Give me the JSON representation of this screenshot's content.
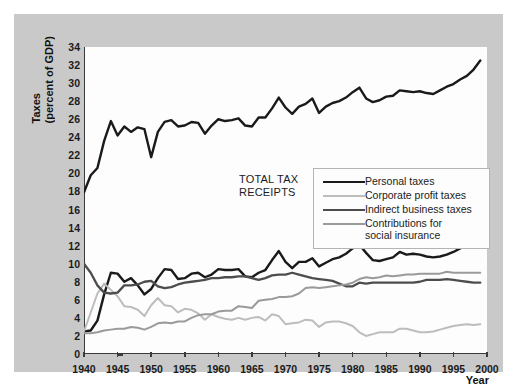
{
  "figure": {
    "annotation": "TOTAL TAX\nRECEIPTS",
    "annotation_line1": "TOTAL TAX",
    "annotation_line2": "RECEIPTS",
    "ytitle_line1": "Taxes",
    "ytitle_line2": "(percent of GDP)",
    "xtitle": "Year",
    "panel_color": "#c9c9c9",
    "plot_bg": "#fdfdfd",
    "axis_color": "#3a3a3a"
  },
  "legend": {
    "position": "inside-upper-center",
    "entries": [
      {
        "label": "Personal taxes",
        "color": "#1a1a1a",
        "width": 2.6
      },
      {
        "label": "Corporate profit taxes",
        "color": "#bdbdbd",
        "width": 2.0
      },
      {
        "label": "Indirect business taxes",
        "color": "#4d4d4d",
        "width": 2.4
      },
      {
        "label": "Contributions for",
        "label2": "social insurance",
        "color": "#9a9a9a",
        "width": 2.0
      }
    ]
  },
  "chart_data": {
    "type": "line",
    "title": "",
    "subtitle": "",
    "xlabel": "Year",
    "ylabel": "Taxes (percent of GDP)",
    "xlim": [
      1940,
      2000
    ],
    "ylim": [
      0,
      34
    ],
    "xticks": [
      1940,
      1945,
      1950,
      1955,
      1960,
      1965,
      1970,
      1975,
      1980,
      1985,
      1990,
      1995,
      2000
    ],
    "yticks": [
      0,
      2,
      4,
      6,
      8,
      10,
      12,
      14,
      16,
      18,
      20,
      22,
      24,
      26,
      28,
      30,
      32,
      34
    ],
    "grid": false,
    "legend_position": "inside-upper-center",
    "annotations": [
      {
        "text": "TOTAL TAX RECEIPTS",
        "x": 1953,
        "y": 23.0
      }
    ],
    "x": [
      1940,
      1941,
      1942,
      1943,
      1944,
      1945,
      1946,
      1947,
      1948,
      1949,
      1950,
      1951,
      1952,
      1953,
      1954,
      1955,
      1956,
      1957,
      1958,
      1959,
      1960,
      1961,
      1962,
      1963,
      1964,
      1965,
      1966,
      1967,
      1968,
      1969,
      1970,
      1971,
      1972,
      1973,
      1974,
      1975,
      1976,
      1977,
      1978,
      1979,
      1980,
      1981,
      1982,
      1983,
      1984,
      1985,
      1986,
      1987,
      1988,
      1989,
      1990,
      1991,
      1992,
      1993,
      1994,
      1995,
      1996,
      1997,
      1998,
      1999
    ],
    "series": [
      {
        "name": "Total tax receipts",
        "color": "#1a1a1a",
        "width": 2.4,
        "labeled_on_chart": true,
        "values": [
          17.9,
          19.8,
          20.6,
          23.6,
          25.8,
          24.2,
          25.2,
          24.6,
          25.1,
          24.9,
          21.8,
          24.6,
          25.7,
          25.9,
          25.2,
          25.3,
          25.7,
          25.6,
          24.4,
          25.3,
          26.0,
          25.8,
          25.9,
          26.1,
          25.3,
          25.2,
          26.2,
          26.2,
          27.2,
          28.4,
          27.3,
          26.6,
          27.4,
          27.7,
          28.3,
          26.7,
          27.4,
          27.8,
          28.0,
          28.4,
          29.0,
          29.5,
          28.3,
          27.9,
          28.1,
          28.5,
          28.6,
          29.2,
          29.1,
          29.0,
          29.1,
          28.9,
          28.8,
          29.2,
          29.6,
          29.9,
          30.4,
          30.8,
          31.5,
          32.5
        ]
      },
      {
        "name": "Personal taxes",
        "color": "#1a1a1a",
        "width": 2.4,
        "values": [
          2.5,
          2.6,
          3.7,
          6.6,
          9.0,
          8.9,
          8.0,
          8.4,
          7.6,
          6.6,
          7.2,
          8.4,
          9.4,
          9.3,
          8.3,
          8.4,
          8.9,
          9.0,
          8.5,
          8.8,
          9.4,
          9.3,
          9.3,
          9.4,
          8.6,
          8.5,
          9.0,
          9.3,
          10.4,
          11.4,
          10.2,
          9.5,
          10.2,
          10.2,
          10.6,
          9.7,
          10.1,
          10.5,
          10.7,
          11.1,
          11.7,
          12.1,
          11.2,
          10.4,
          10.3,
          10.5,
          10.7,
          11.3,
          11.0,
          11.1,
          11.0,
          10.8,
          10.7,
          10.8,
          11.0,
          11.3,
          11.7,
          12.1,
          12.5,
          12.8
        ]
      },
      {
        "name": "Corporate profit taxes",
        "color": "#bdbdbd",
        "width": 2.0,
        "values": [
          2.5,
          4.6,
          6.7,
          7.8,
          7.1,
          6.4,
          5.3,
          5.2,
          4.9,
          4.2,
          5.4,
          6.2,
          5.4,
          5.3,
          4.6,
          5.0,
          4.9,
          4.5,
          3.8,
          4.4,
          4.1,
          3.9,
          3.8,
          4.0,
          3.8,
          4.0,
          4.1,
          3.7,
          4.4,
          4.2,
          3.3,
          3.4,
          3.5,
          3.8,
          3.7,
          3.0,
          3.5,
          3.6,
          3.6,
          3.4,
          3.1,
          2.4,
          2.0,
          2.2,
          2.4,
          2.4,
          2.4,
          2.8,
          2.8,
          2.6,
          2.4,
          2.4,
          2.5,
          2.7,
          2.9,
          3.1,
          3.2,
          3.3,
          3.2,
          3.3
        ]
      },
      {
        "name": "Indirect business taxes",
        "color": "#4d4d4d",
        "width": 2.3,
        "values": [
          10.0,
          9.0,
          7.6,
          6.8,
          6.7,
          6.8,
          7.6,
          7.6,
          7.7,
          8.0,
          8.1,
          7.5,
          7.3,
          7.4,
          7.7,
          7.9,
          8.0,
          8.1,
          8.2,
          8.4,
          8.4,
          8.5,
          8.5,
          8.6,
          8.6,
          8.4,
          8.2,
          8.4,
          8.7,
          8.8,
          8.8,
          9.0,
          8.8,
          8.6,
          8.4,
          8.3,
          8.2,
          8.1,
          7.8,
          7.5,
          7.5,
          7.9,
          7.8,
          7.9,
          7.9,
          7.9,
          7.9,
          7.9,
          7.9,
          7.9,
          8.0,
          8.2,
          8.2,
          8.2,
          8.3,
          8.2,
          8.1,
          8.0,
          7.9,
          7.9
        ]
      },
      {
        "name": "Contributions for social insurance",
        "color": "#9a9a9a",
        "width": 2.0,
        "values": [
          2.3,
          2.3,
          2.4,
          2.6,
          2.7,
          2.8,
          2.8,
          3.0,
          2.9,
          2.7,
          3.0,
          3.4,
          3.5,
          3.4,
          3.6,
          3.6,
          4.0,
          4.3,
          4.4,
          4.4,
          4.7,
          4.8,
          4.8,
          5.3,
          5.2,
          5.1,
          5.9,
          6.0,
          6.1,
          6.3,
          6.3,
          6.4,
          6.7,
          7.3,
          7.4,
          7.3,
          7.4,
          7.5,
          7.6,
          7.7,
          7.9,
          8.3,
          8.5,
          8.4,
          8.5,
          8.7,
          8.6,
          8.7,
          8.8,
          8.8,
          8.9,
          8.9,
          8.9,
          8.9,
          9.1,
          9.0,
          9.0,
          9.0,
          9.0,
          9.0
        ]
      }
    ]
  }
}
